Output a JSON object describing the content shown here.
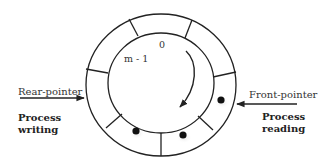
{
  "diagram": {
    "type": "circular-buffer",
    "slot_labels": {
      "first": "0",
      "last": "m - 1"
    },
    "rear_pointer": {
      "label": "Rear-pointer",
      "process": [
        "Process",
        "writing"
      ]
    },
    "front_pointer": {
      "label": "Front-pointer",
      "process": [
        "Process",
        "reading"
      ]
    },
    "segments": 8,
    "filled_slots": 3,
    "colors": {
      "stroke": "#222222",
      "dot": "#111111"
    }
  }
}
